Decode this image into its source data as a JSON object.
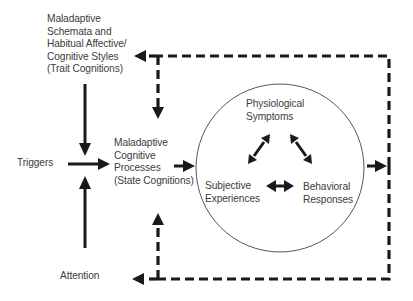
{
  "diagram": {
    "type": "flow-model",
    "nodes": {
      "trait": {
        "lines": [
          "Maladaptive",
          "Schemata and",
          "Habitual Affective/",
          "Cognitive Styles",
          "(Trait Cognitions)"
        ]
      },
      "triggers": {
        "lines": [
          "Triggers"
        ]
      },
      "attention": {
        "lines": [
          "Attention"
        ]
      },
      "state": {
        "lines": [
          "Maladaptive",
          "Cognitive",
          "Processes",
          "(State Cognitions)"
        ]
      },
      "physiological": {
        "lines": [
          "Physiological",
          "Symptoms"
        ]
      },
      "subjective": {
        "lines": [
          "Subjective",
          "Experiences"
        ]
      },
      "behavioral": {
        "lines": [
          "Behavioral",
          "Responses"
        ]
      }
    },
    "edges": [
      {
        "from": "trait",
        "to": "state",
        "style": "solid"
      },
      {
        "from": "triggers",
        "to": "state",
        "style": "solid"
      },
      {
        "from": "attention",
        "to": "state",
        "style": "solid"
      },
      {
        "from": "state",
        "to": "response-circle",
        "style": "solid"
      },
      {
        "from": "physiological",
        "to": "subjective",
        "style": "solid",
        "bidirectional": true
      },
      {
        "from": "physiological",
        "to": "behavioral",
        "style": "solid",
        "bidirectional": true
      },
      {
        "from": "subjective",
        "to": "behavioral",
        "style": "solid",
        "bidirectional": true
      },
      {
        "from": "response-circle",
        "to": "feedback-loop",
        "style": "solid"
      },
      {
        "from": "feedback-loop",
        "to": "trait",
        "style": "dashed"
      },
      {
        "from": "feedback-loop",
        "to": "state",
        "style": "dashed"
      },
      {
        "from": "feedback-loop",
        "to": "attention",
        "style": "dashed"
      }
    ],
    "colors": {
      "line": "#1a1a1a",
      "text": "#3c3c3c",
      "circle": "#555555",
      "background": "#ffffff"
    }
  }
}
